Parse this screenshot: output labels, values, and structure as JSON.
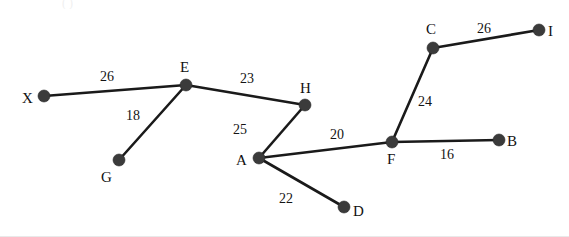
{
  "figure": {
    "width": 569,
    "height": 237,
    "background_color": "#ffffff",
    "node_color": "#3b3b3b",
    "edge_color": "#1a1a1a",
    "text_color": "#111111",
    "partial_top_text": "(  )"
  },
  "chart_data": {
    "type": "diagram",
    "title": "",
    "graph_kind": "weighted-undirected-graph",
    "nodes": [
      {
        "id": "X",
        "label": "X",
        "x": 44,
        "y": 96,
        "label_x": 22,
        "label_y": 91,
        "label_pos": "left"
      },
      {
        "id": "E",
        "label": "E",
        "x": 186,
        "y": 85,
        "label_x": 180,
        "label_y": 60,
        "label_pos": "above"
      },
      {
        "id": "G",
        "label": "G",
        "x": 119,
        "y": 160,
        "label_x": 101,
        "label_y": 170,
        "label_pos": "below"
      },
      {
        "id": "H",
        "label": "H",
        "x": 305,
        "y": 105,
        "label_x": 300,
        "label_y": 81,
        "label_pos": "above"
      },
      {
        "id": "A",
        "label": "A",
        "x": 259,
        "y": 158,
        "label_x": 236,
        "label_y": 153,
        "label_pos": "left"
      },
      {
        "id": "D",
        "label": "D",
        "x": 344,
        "y": 207,
        "label_x": 353,
        "label_y": 204,
        "label_pos": "right"
      },
      {
        "id": "F",
        "label": "F",
        "x": 392,
        "y": 142,
        "label_x": 387,
        "label_y": 152,
        "label_pos": "below"
      },
      {
        "id": "B",
        "label": "B",
        "x": 499,
        "y": 140,
        "label_x": 507,
        "label_y": 134,
        "label_pos": "right"
      },
      {
        "id": "C",
        "label": "C",
        "x": 433,
        "y": 48,
        "label_x": 426,
        "label_y": 22,
        "label_pos": "above"
      },
      {
        "id": "I",
        "label": "I",
        "x": 539,
        "y": 30,
        "label_x": 548,
        "label_y": 24,
        "label_pos": "right"
      }
    ],
    "edges": [
      {
        "source": "X",
        "target": "E",
        "weight": 26,
        "label": "26",
        "label_x": 100,
        "label_y": 70
      },
      {
        "source": "E",
        "target": "G",
        "weight": 18,
        "label": "18",
        "label_x": 126,
        "label_y": 109
      },
      {
        "source": "E",
        "target": "H",
        "weight": 23,
        "label": "23",
        "label_x": 240,
        "label_y": 72
      },
      {
        "source": "H",
        "target": "A",
        "weight": 25,
        "label": "25",
        "label_x": 233,
        "label_y": 123
      },
      {
        "source": "A",
        "target": "F",
        "weight": 20,
        "label": "20",
        "label_x": 330,
        "label_y": 128
      },
      {
        "source": "A",
        "target": "D",
        "weight": 22,
        "label": "22",
        "label_x": 279,
        "label_y": 192
      },
      {
        "source": "F",
        "target": "B",
        "weight": 16,
        "label": "16",
        "label_x": 440,
        "label_y": 148
      },
      {
        "source": "F",
        "target": "C",
        "weight": 24,
        "label": "24",
        "label_x": 418,
        "label_y": 95
      },
      {
        "source": "C",
        "target": "I",
        "weight": 26,
        "label": "26",
        "label_x": 477,
        "label_y": 22
      }
    ],
    "node_radius": 6,
    "edge_width": 2.6,
    "weights_summary": [
      26,
      18,
      23,
      25,
      20,
      22,
      16,
      24,
      26
    ]
  }
}
